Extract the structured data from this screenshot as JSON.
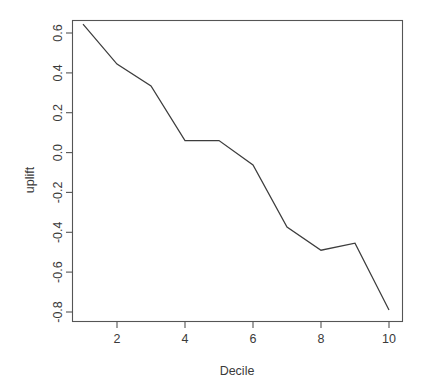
{
  "chart_data": {
    "type": "line",
    "title": "",
    "subtitle": "",
    "xlabel": "Decile",
    "ylabel": "uplift",
    "x": [
      1,
      2,
      3,
      4,
      5,
      6,
      7,
      8,
      9,
      10
    ],
    "values": [
      0.645,
      0.444,
      0.334,
      0.06,
      0.06,
      -0.062,
      -0.374,
      -0.49,
      -0.455,
      -0.79
    ],
    "series": [
      {
        "name": "uplift",
        "values": [
          0.645,
          0.444,
          0.334,
          0.06,
          0.06,
          -0.062,
          -0.374,
          -0.49,
          -0.455,
          -0.79
        ]
      }
    ],
    "xlim": [
      0.7,
      10.3
    ],
    "ylim": [
      -0.83,
      0.7
    ],
    "x_tick_labels": [
      "2",
      "4",
      "6",
      "8",
      "10"
    ],
    "x_tick_values": [
      2,
      4,
      6,
      8,
      10
    ],
    "y_tick_labels": [
      "0.6",
      "0.4",
      "0.2",
      "0.0",
      "-0.2",
      "-0.4",
      "-0.6",
      "-0.8"
    ],
    "y_tick_values": [
      0.6,
      0.4,
      0.2,
      0.0,
      -0.2,
      -0.4,
      -0.6,
      -0.8
    ],
    "grid": false,
    "legend": false,
    "legend_position": "none",
    "line_color": "#3d3d3d",
    "frame_color": "#555555",
    "background_color": "#ffffff",
    "markers": false,
    "annotations": []
  },
  "axes": {
    "y_title": "uplift",
    "x_title": "Decile"
  }
}
